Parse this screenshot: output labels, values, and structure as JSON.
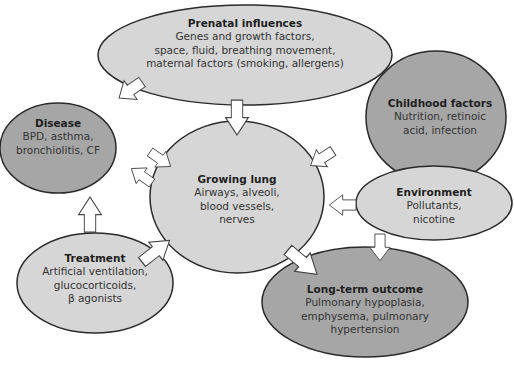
{
  "colors": {
    "light_fill": "#d6d6d6",
    "dark_fill": "#a6a6a6",
    "stroke": "#2a2a2a",
    "arrow_fill": "#ffffff"
  },
  "nodes": {
    "prenatal": {
      "title": "Prenatal influences",
      "lines": [
        "Genes and growth factors,",
        "space, fluid, breathing movement,",
        "maternal factors (smoking, allergens)"
      ]
    },
    "disease": {
      "title": "Disease",
      "lines": [
        "BPD, asthma,",
        "bronchiolitis, CF"
      ]
    },
    "childhood": {
      "title": "Childhood factors",
      "lines": [
        "Nutrition, retinoic",
        "acid, infection"
      ]
    },
    "growing_lung": {
      "title": "Growing lung",
      "lines": [
        "Airways, alveoli,",
        "blood vessels,",
        "nerves"
      ]
    },
    "environment": {
      "title": "Environment",
      "lines": [
        "Pollutants,",
        "nicotine"
      ]
    },
    "treatment": {
      "title": "Treatment",
      "lines": [
        "Artificial ventilation,",
        "glucocorticoids,",
        "β agonists"
      ]
    },
    "outcome": {
      "title": "Long-term outcome",
      "lines": [
        "Pulmonary hypoplasia,",
        "emphysema, pulmonary",
        "hypertension"
      ]
    }
  },
  "arrows": [
    {
      "from": "Prenatal influences",
      "to": "Growing lung"
    },
    {
      "from": "Prenatal influences",
      "to": "Disease"
    },
    {
      "from": "Childhood factors",
      "to": "Growing lung"
    },
    {
      "from": "Environment",
      "to": "Growing lung"
    },
    {
      "from": "Environment",
      "to": "Long-term outcome"
    },
    {
      "from": "Disease",
      "to": "Growing lung"
    },
    {
      "from": "Growing lung",
      "to": "Disease"
    },
    {
      "from": "Treatment",
      "to": "Disease"
    },
    {
      "from": "Treatment",
      "to": "Growing lung"
    },
    {
      "from": "Growing lung",
      "to": "Long-term outcome"
    }
  ]
}
